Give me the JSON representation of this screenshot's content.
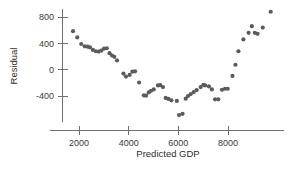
{
  "chart_data": {
    "type": "scatter",
    "title": "",
    "xlabel": "Predicted GDP",
    "ylabel": "Residual",
    "xlim": [
      1000,
      10200
    ],
    "ylim": [
      -800,
      1000
    ],
    "xticks": [
      2000,
      4000,
      6000,
      8000
    ],
    "xtick_labels": [
      "2000",
      "4000",
      "6000",
      "8000"
    ],
    "yticks": [
      -400,
      0,
      400,
      800
    ],
    "ytick_labels": [
      "-400",
      "0",
      "400",
      "800"
    ],
    "grid": false,
    "legend": null,
    "marker_color": "#5b5b5b",
    "axis_color": "#707070",
    "points": [
      [
        1760,
        585
      ],
      [
        1930,
        490
      ],
      [
        2090,
        390
      ],
      [
        2230,
        355
      ],
      [
        2350,
        350
      ],
      [
        2440,
        340
      ],
      [
        2560,
        300
      ],
      [
        2680,
        280
      ],
      [
        2790,
        275
      ],
      [
        2900,
        290
      ],
      [
        3010,
        320
      ],
      [
        3120,
        325
      ],
      [
        3230,
        250
      ],
      [
        3330,
        215
      ],
      [
        3420,
        195
      ],
      [
        3530,
        140
      ],
      [
        3790,
        -60
      ],
      [
        3890,
        -105
      ],
      [
        4040,
        -80
      ],
      [
        4150,
        -30
      ],
      [
        4260,
        -25
      ],
      [
        4420,
        -195
      ],
      [
        4610,
        -390
      ],
      [
        4700,
        -395
      ],
      [
        4810,
        -345
      ],
      [
        4900,
        -320
      ],
      [
        5010,
        -300
      ],
      [
        5180,
        -240
      ],
      [
        5270,
        -235
      ],
      [
        5380,
        -265
      ],
      [
        5490,
        -430
      ],
      [
        5600,
        -445
      ],
      [
        5720,
        -465
      ],
      [
        5940,
        -475
      ],
      [
        6030,
        -690
      ],
      [
        6170,
        -670
      ],
      [
        6300,
        -440
      ],
      [
        6390,
        -400
      ],
      [
        6500,
        -370
      ],
      [
        6620,
        -340
      ],
      [
        6740,
        -310
      ],
      [
        6900,
        -265
      ],
      [
        7010,
        -230
      ],
      [
        7080,
        -240
      ],
      [
        7230,
        -255
      ],
      [
        7350,
        -300
      ],
      [
        7480,
        -450
      ],
      [
        7610,
        -450
      ],
      [
        7760,
        -305
      ],
      [
        7880,
        -290
      ],
      [
        7990,
        -290
      ],
      [
        8180,
        -95
      ],
      [
        8300,
        75
      ],
      [
        8420,
        280
      ],
      [
        8620,
        460
      ],
      [
        8830,
        560
      ],
      [
        8960,
        660
      ],
      [
        9080,
        560
      ],
      [
        9190,
        545
      ],
      [
        9400,
        640
      ],
      [
        9720,
        880
      ]
    ]
  }
}
